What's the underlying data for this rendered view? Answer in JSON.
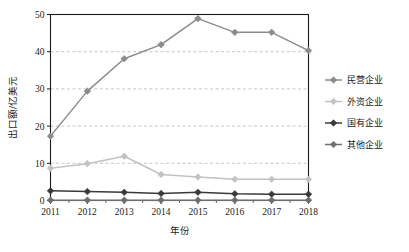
{
  "chart_data": {
    "type": "line",
    "title": "",
    "xlabel": "年份",
    "ylabel": "出口额/亿美元",
    "categories": [
      "2011",
      "2012",
      "2013",
      "2014",
      "2015",
      "2016",
      "2017",
      "2018"
    ],
    "x": [
      2011,
      2012,
      2013,
      2014,
      2015,
      2016,
      2017,
      2018
    ],
    "xlim": [
      2011,
      2018
    ],
    "ylim": [
      0,
      50
    ],
    "yticks": [
      0,
      10,
      20,
      30,
      40,
      50
    ],
    "ytick_labels": [
      "0",
      "10",
      "20",
      "30",
      "40",
      "50"
    ],
    "grid": "horizontal-dashed",
    "legend_position": "right",
    "marker": "diamond",
    "series": [
      {
        "name": "民营企业",
        "color": "#8c8c8c",
        "values": [
          17.3,
          29.4,
          38.1,
          41.9,
          48.9,
          45.2,
          45.2,
          40.3
        ]
      },
      {
        "name": "外资企业",
        "color": "#c2c2c2",
        "values": [
          8.7,
          9.9,
          11.9,
          7.0,
          6.3,
          5.7,
          5.7,
          5.7
        ]
      },
      {
        "name": "国有企业",
        "color": "#3a3a3a",
        "values": [
          2.6,
          2.4,
          2.2,
          1.9,
          2.2,
          1.8,
          1.7,
          1.7
        ]
      },
      {
        "name": "其他企业",
        "color": "#6e6e6e",
        "values": [
          0.1,
          0.1,
          0.1,
          0.1,
          0.1,
          0.1,
          0.1,
          0.1
        ]
      }
    ]
  },
  "colors": {
    "axis": "#1a1a1a",
    "grid": "#b8b8c8",
    "background": "#ffffff"
  }
}
